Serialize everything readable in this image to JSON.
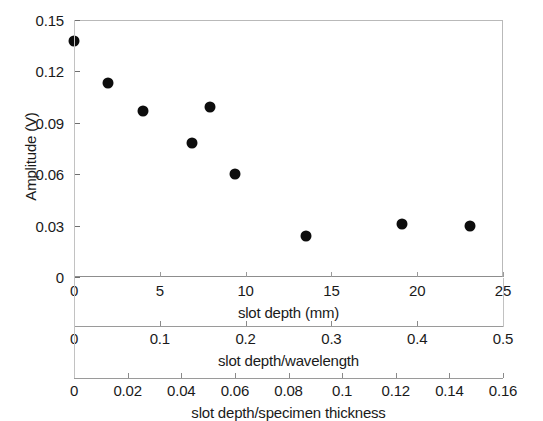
{
  "chart_data": {
    "type": "scatter",
    "title": "",
    "ylabel": "Amplitude (V)",
    "ylim": [
      0,
      0.15
    ],
    "yticks": [
      0,
      0.03,
      0.06,
      0.09,
      0.12,
      0.15
    ],
    "ytick_labels": [
      "0",
      "0.03",
      "0.06",
      "0.09",
      "0.12",
      "0.15"
    ],
    "grid": false,
    "legend": null,
    "marker": "filled-circle",
    "marker_color": "#0d0d0d",
    "xlabel": "slot depth (mm)",
    "xlim": [
      0,
      25
    ],
    "xticks": [
      0,
      5,
      10,
      15,
      20,
      25
    ],
    "xtick_labels": [
      "0",
      "5",
      "10",
      "15",
      "20",
      "25"
    ],
    "x": [
      0.0,
      2.0,
      4.0,
      6.9,
      7.9,
      9.4,
      13.5,
      19.1,
      23.1
    ],
    "y": [
      0.138,
      0.113,
      0.097,
      0.078,
      0.099,
      0.06,
      0.024,
      0.031,
      0.03
    ],
    "series": [
      {
        "name": "amplitude vs slot depth",
        "points": [
          {
            "x": 0.0,
            "y": 0.138
          },
          {
            "x": 2.0,
            "y": 0.113
          },
          {
            "x": 4.0,
            "y": 0.097
          },
          {
            "x": 6.9,
            "y": 0.078
          },
          {
            "x": 7.9,
            "y": 0.099
          },
          {
            "x": 9.4,
            "y": 0.06
          },
          {
            "x": 13.5,
            "y": 0.024
          },
          {
            "x": 19.1,
            "y": 0.031
          },
          {
            "x": 23.1,
            "y": 0.03
          }
        ]
      }
    ],
    "secondary_axes": [
      {
        "label": "slot depth/wavelength",
        "lim": [
          0,
          0.5
        ],
        "ticks": [
          0,
          0.1,
          0.2,
          0.3,
          0.4,
          0.5
        ],
        "tick_labels": [
          "0",
          "0.1",
          "0.2",
          "0.3",
          "0.4",
          "0.5"
        ]
      },
      {
        "label": "slot depth/specimen thickness",
        "lim": [
          0,
          0.16
        ],
        "ticks": [
          0,
          0.02,
          0.04,
          0.06,
          0.08,
          0.1,
          0.12,
          0.14,
          0.16
        ],
        "tick_labels": [
          "0",
          "0.02",
          "0.04",
          "0.06",
          "0.08",
          "0.1",
          "0.12",
          "0.14",
          "0.16"
        ]
      }
    ]
  },
  "axes": {
    "primary": {
      "title": "slot depth (mm)",
      "zero_label": "0",
      "tick_labels": [
        "0",
        "5",
        "10",
        "15",
        "20",
        "25"
      ]
    },
    "secondary": {
      "title": "slot depth/wavelength",
      "tick_labels": [
        "0",
        "0.1",
        "0.2",
        "0.3",
        "0.4",
        "0.5"
      ]
    },
    "tertiary": {
      "title": "slot depth/specimen thickness",
      "tick_labels": [
        "0",
        "0.02",
        "0.04",
        "0.06",
        "0.08",
        "0.1",
        "0.12",
        "0.14",
        "0.16"
      ]
    },
    "y": {
      "title": "Amplitude (V)",
      "tick_labels": [
        "0",
        "0.03",
        "0.06",
        "0.09",
        "0.12",
        "0.15"
      ]
    }
  }
}
